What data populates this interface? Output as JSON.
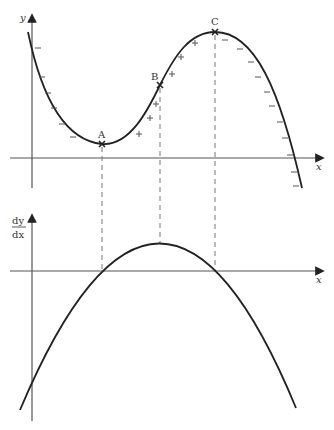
{
  "top_graph": {
    "y_axis_label": "y",
    "x_axis_label": "x",
    "points": [
      {
        "label": "A",
        "x": 102,
        "y": 144,
        "type": "minimum"
      },
      {
        "label": "B",
        "x": 160,
        "y": 85,
        "type": "inflection"
      },
      {
        "label": "C",
        "x": 215,
        "y": 32,
        "type": "maximum"
      }
    ],
    "minus_signs": [
      [
        38,
        48
      ],
      [
        42,
        77
      ],
      [
        48,
        93
      ],
      [
        54,
        108
      ],
      [
        62,
        124
      ],
      [
        73,
        137
      ],
      [
        225,
        40
      ],
      [
        240,
        49
      ],
      [
        251,
        62
      ],
      [
        258,
        77
      ],
      [
        267,
        92
      ],
      [
        272,
        106
      ],
      [
        280,
        122
      ],
      [
        285,
        138
      ],
      [
        290,
        155
      ],
      [
        294,
        172
      ],
      [
        296,
        186
      ]
    ],
    "plus_signs": [
      [
        139,
        134
      ],
      [
        150,
        118
      ],
      [
        156,
        104
      ],
      [
        172,
        74
      ],
      [
        181,
        57
      ],
      [
        195,
        43
      ]
    ]
  },
  "bottom_graph": {
    "y_axis_label_numerator": "dy",
    "y_axis_label_denominator": "dx",
    "x_axis_label": "x",
    "peak": {
      "x": 160,
      "y": 244
    },
    "roots": [
      102,
      215
    ]
  },
  "colors": {
    "curve": "#222222",
    "axis": "#555555",
    "dashed": "#777777",
    "text": "#333333"
  }
}
